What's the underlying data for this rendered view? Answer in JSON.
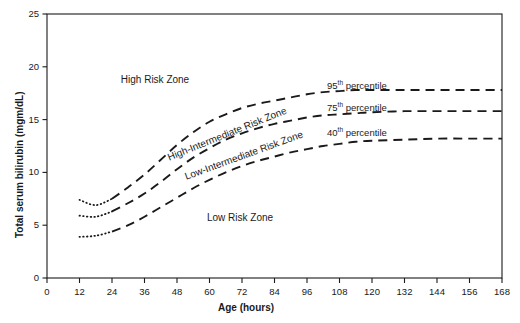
{
  "chart_data": {
    "type": "line",
    "title": "",
    "xlabel": "Age (hours)",
    "ylabel": "Total serum bilirubin (mgm/dL)",
    "xlim": [
      0,
      168
    ],
    "ylim": [
      0,
      25
    ],
    "xticks": [
      0,
      12,
      24,
      36,
      48,
      60,
      72,
      84,
      96,
      108,
      120,
      132,
      144,
      156,
      168
    ],
    "yticks": [
      0,
      5,
      10,
      15,
      20,
      25
    ],
    "grid": false,
    "legend": "inline-annotations",
    "linestyle": "dashed",
    "color": "#000000",
    "x": [
      12,
      18,
      24,
      30,
      36,
      42,
      48,
      54,
      60,
      66,
      72,
      78,
      84,
      90,
      96,
      102,
      108,
      114,
      120,
      132,
      144,
      156,
      168
    ],
    "series": [
      {
        "name": "95th percentile",
        "label": "95",
        "suffix": "th percentile",
        "values": [
          7.4,
          6.9,
          7.5,
          8.6,
          9.8,
          11.2,
          12.6,
          13.8,
          14.8,
          15.5,
          16.1,
          16.5,
          16.8,
          17.1,
          17.4,
          17.6,
          17.7,
          17.8,
          17.8,
          17.8,
          17.8,
          17.8,
          17.8
        ]
      },
      {
        "name": "75th percentile",
        "label": "75",
        "suffix": "th percentile",
        "values": [
          5.9,
          5.8,
          6.3,
          7.1,
          8.0,
          9.1,
          10.3,
          11.4,
          12.3,
          13.1,
          13.7,
          14.2,
          14.6,
          14.9,
          15.2,
          15.4,
          15.5,
          15.6,
          15.7,
          15.8,
          15.8,
          15.8,
          15.8
        ]
      },
      {
        "name": "40th percentile",
        "label": "40",
        "suffix": "th percentile",
        "values": [
          3.9,
          4.0,
          4.4,
          5.0,
          5.8,
          6.7,
          7.6,
          8.5,
          9.3,
          10.0,
          10.6,
          11.1,
          11.5,
          11.9,
          12.2,
          12.5,
          12.7,
          12.9,
          13.0,
          13.1,
          13.2,
          13.2,
          13.2
        ]
      }
    ],
    "zones": [
      {
        "id": "high-risk",
        "text": "High Risk Zone",
        "x": 155,
        "y": 74,
        "rotation": 0
      },
      {
        "id": "high-intermediate-risk",
        "text": "High-Intermediate Risk Zone",
        "x": 168,
        "y": 152,
        "rotation": -22
      },
      {
        "id": "low-intermediate-risk",
        "text": "Low-Intermediate Risk Zone",
        "x": 185,
        "y": 171,
        "rotation": -20
      },
      {
        "id": "low-risk",
        "text": "Low Risk Zone",
        "x": 240,
        "y": 212,
        "rotation": 0
      }
    ],
    "annotations": [
      {
        "id": "pct-95",
        "number": "95",
        "text": "th percentile",
        "x": 327,
        "y": 79
      },
      {
        "id": "pct-75",
        "number": "75",
        "text": "th percentile",
        "x": 327,
        "y": 101
      },
      {
        "id": "pct-40",
        "number": "40",
        "text": "th percentile",
        "x": 327,
        "y": 126
      }
    ]
  }
}
